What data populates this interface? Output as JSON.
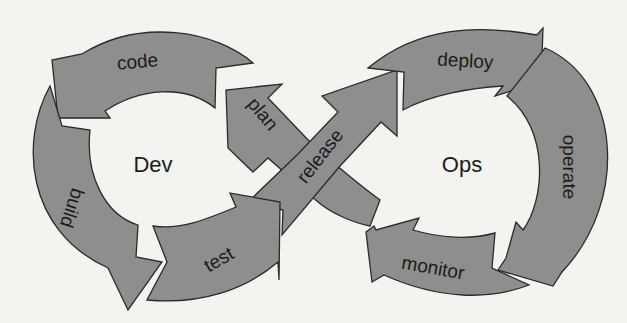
{
  "diagram": {
    "type": "devops-infinity-loop",
    "colors": {
      "background": "#f3f3f1",
      "arrow_fill": "#8e8e8e",
      "arrow_stroke": "#2a2a2a",
      "text": "#1c1c1c"
    },
    "loops": [
      {
        "id": "dev",
        "label": "Dev"
      },
      {
        "id": "ops",
        "label": "Ops"
      }
    ],
    "stages": [
      {
        "id": "plan",
        "label": "plan",
        "loop": "dev"
      },
      {
        "id": "code",
        "label": "code",
        "loop": "dev"
      },
      {
        "id": "build",
        "label": "build",
        "loop": "dev"
      },
      {
        "id": "test",
        "label": "test",
        "loop": "dev"
      },
      {
        "id": "release",
        "label": "release",
        "loop": "crossing"
      },
      {
        "id": "deploy",
        "label": "deploy",
        "loop": "ops"
      },
      {
        "id": "operate",
        "label": "operate",
        "loop": "ops"
      },
      {
        "id": "monitor",
        "label": "monitor",
        "loop": "ops"
      }
    ]
  }
}
